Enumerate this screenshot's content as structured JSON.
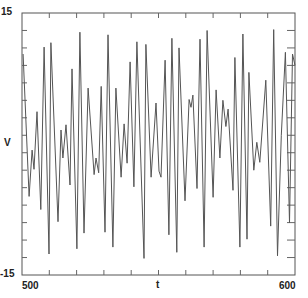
{
  "chart_data": {
    "type": "line",
    "title": "",
    "xlabel": "t",
    "ylabel": "V",
    "xlim": [
      500,
      600
    ],
    "ylim": [
      -15,
      15
    ],
    "x_tick_labels": [
      "500",
      "600"
    ],
    "y_tick_labels": [
      "15",
      "-15"
    ],
    "x_minor_tick_step": 10,
    "y_minor_tick_step": 2,
    "grid": false,
    "legend": null,
    "line_color": "#555555",
    "series": [
      {
        "name": "V(t)",
        "points": [
          [
            500.4,
            10.3
          ],
          [
            502.6,
            -6.0
          ],
          [
            503.7,
            -0.7
          ],
          [
            504.4,
            -2.9
          ],
          [
            505.5,
            3.7
          ],
          [
            506.9,
            -7.5
          ],
          [
            508.1,
            11.1
          ],
          [
            509.9,
            -12.6
          ],
          [
            510.6,
            11.6
          ],
          [
            513.2,
            -8.9
          ],
          [
            514.3,
            1.6
          ],
          [
            515.0,
            -1.6
          ],
          [
            516.1,
            2.2
          ],
          [
            517.6,
            -4.7
          ],
          [
            518.3,
            8.6
          ],
          [
            520.1,
            -12.0
          ],
          [
            521.2,
            12.8
          ],
          [
            522.7,
            -10.2
          ],
          [
            524.2,
            6.4
          ],
          [
            526.4,
            -3.5
          ],
          [
            527.1,
            -1.6
          ],
          [
            528.1,
            -3.3
          ],
          [
            529.0,
            6.6
          ],
          [
            530.4,
            -10.1
          ],
          [
            531.5,
            12.5
          ],
          [
            533.3,
            -11.8
          ],
          [
            534.4,
            6.4
          ],
          [
            536.3,
            -3.8
          ],
          [
            537.4,
            2.3
          ],
          [
            538.5,
            -2.2
          ],
          [
            539.6,
            9.4
          ],
          [
            541.0,
            -4.9
          ],
          [
            542.1,
            11.7
          ],
          [
            544.7,
            -13.1
          ],
          [
            545.4,
            11.4
          ],
          [
            547.3,
            -3.8
          ],
          [
            549.1,
            4.7
          ],
          [
            550.2,
            -3.1
          ],
          [
            550.9,
            -3.8
          ],
          [
            552.4,
            9.6
          ],
          [
            553.8,
            -10.4
          ],
          [
            554.9,
            12.1
          ],
          [
            556.7,
            -12.4
          ],
          [
            557.5,
            11.0
          ],
          [
            559.7,
            -6.5
          ],
          [
            561.2,
            5.1
          ],
          [
            561.9,
            4.2
          ],
          [
            562.6,
            5.6
          ],
          [
            564.1,
            -5.1
          ],
          [
            565.2,
            12.0
          ],
          [
            566.7,
            -11.8
          ],
          [
            567.8,
            13.0
          ],
          [
            570.0,
            -6.1
          ],
          [
            571.1,
            6.2
          ],
          [
            572.5,
            -1.6
          ],
          [
            573.6,
            5.0
          ],
          [
            574.7,
            2.0
          ],
          [
            575.5,
            4.0
          ],
          [
            577.3,
            -5.3
          ],
          [
            578.0,
            9.9
          ],
          [
            579.8,
            -11.8
          ],
          [
            580.9,
            12.6
          ],
          [
            582.4,
            -10.9
          ],
          [
            583.1,
            8.2
          ],
          [
            584.9,
            -3.0
          ],
          [
            586.0,
            0.2
          ],
          [
            587.1,
            -2.1
          ],
          [
            589.3,
            7.3
          ],
          [
            591.1,
            -9.4
          ],
          [
            592.2,
            13.1
          ],
          [
            593.6,
            -12.8
          ],
          [
            595.0,
            1.0
          ],
          [
            596.5,
            10.5
          ],
          [
            598.0,
            -9.0
          ],
          [
            599.1,
            10.3
          ],
          [
            600.0,
            9.0
          ]
        ]
      }
    ]
  },
  "axes": {
    "y_top_label": "15",
    "y_bottom_label": "-15",
    "y_axis_title": "V",
    "x_left_label": "500",
    "x_right_label": "600",
    "x_axis_title": "t"
  }
}
